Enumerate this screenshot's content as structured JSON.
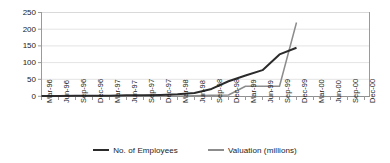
{
  "chart_data": {
    "type": "line",
    "title": "",
    "xlabel": "",
    "ylabel": "",
    "ylim": [
      0,
      250
    ],
    "yticks": [
      0,
      50,
      100,
      150,
      200,
      250
    ],
    "grid": true,
    "legend_position": "bottom",
    "categories": [
      "Mar-96",
      "Jun-96",
      "Sep-96",
      "Dec-96",
      "Mar-97",
      "Jun-97",
      "Sep-97",
      "Dec-97",
      "Mar-98",
      "Jun-98",
      "Sep-98",
      "Dec-98",
      "Mar-99",
      "Jun-99",
      "Sep-99",
      "Dec-99",
      "Mar-00",
      "Jun-00",
      "Sep-00",
      "Dec-00"
    ],
    "series": [
      {
        "name": "No. of Employees",
        "color": "#2b2b2b",
        "x": [
          "Mar-96",
          "Jun-96",
          "Sep-96",
          "Dec-96",
          "Mar-97",
          "Jun-97",
          "Sep-97",
          "Dec-97",
          "Mar-98",
          "Jun-98",
          "Sep-98",
          "Dec-98",
          "Mar-99",
          "Jun-99",
          "Sep-99",
          "Dec-99"
        ],
        "values": [
          1,
          1,
          2,
          2,
          2,
          3,
          3,
          4,
          6,
          10,
          22,
          45,
          62,
          78,
          125,
          145
        ]
      },
      {
        "name": "Valuation (millions)",
        "color": "#8c8c8c",
        "x": [
          "Mar-96",
          "Jun-96",
          "Sep-96",
          "Dec-96",
          "Mar-97",
          "Jun-97",
          "Sep-97",
          "Dec-97",
          "Mar-98",
          "Jun-98",
          "Sep-98",
          "Dec-98",
          "Mar-99",
          "Jun-99",
          "Sep-99",
          "Dec-99"
        ],
        "values": [
          0,
          0,
          0,
          0,
          0,
          0,
          0,
          0,
          0,
          2,
          3,
          4,
          30,
          30,
          30,
          220
        ]
      }
    ]
  },
  "legend": {
    "items": [
      {
        "label": "No. of  Employees",
        "style": "thick"
      },
      {
        "label": "Valuation (millions)",
        "style": "thin"
      }
    ]
  },
  "yaxis": {
    "ticks": [
      "250",
      "200",
      "150",
      "100",
      "50",
      "0"
    ]
  },
  "xaxis": {
    "ticks": [
      "Mar-96",
      "Jun-96",
      "Sep-96",
      "Dec-96",
      "Mar-97",
      "Jun-97",
      "Sep-97",
      "Dec-97",
      "Mar-98",
      "Jun-98",
      "Sep-98",
      "Dec-98",
      "Mar-99",
      "Jun-99",
      "Sep-99",
      "Dec-99",
      "Mar-00",
      "Jun-00",
      "Sep-00",
      "Dec-00"
    ]
  },
  "colors": {
    "employees_line": "#2b2b2b",
    "valuation_line": "#8c8c8c",
    "gridline": "#e2e2e2",
    "axis": "#9a9a9a",
    "text": "#1a1a1a"
  }
}
